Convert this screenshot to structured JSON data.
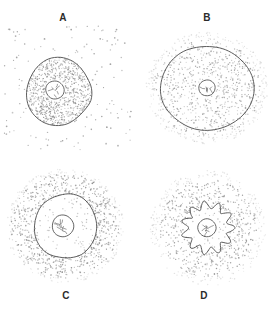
{
  "figure": {
    "background_color": "#ffffff",
    "ink_color": "#4a4a4a",
    "stipple_color": "#8d8d8d",
    "width": 273,
    "height": 311
  },
  "panels": [
    {
      "id": "A",
      "label": "A",
      "label_position": "above",
      "label_x": 63,
      "label_y": 12,
      "cell_shape": "irregular-rounded",
      "cell_center_x": 58,
      "cell_center_y": 92,
      "cell_radius": 33,
      "nucleus_center_x": 55,
      "nucleus_center_y": 90,
      "nucleus_radius": 9,
      "interior_stipple": "dense",
      "exterior_stipple": "sparse",
      "interior_dot_count": 760,
      "exterior_dot_count": 120,
      "description": "Cell with concentrated interior, dilute surroundings"
    },
    {
      "id": "B",
      "label": "B",
      "label_position": "above",
      "label_x": 207,
      "label_y": 12,
      "cell_shape": "smooth-ellipse",
      "cell_center_x": 207,
      "cell_center_y": 88,
      "cell_radius": 47,
      "nucleus_center_x": 207,
      "nucleus_center_y": 88,
      "nucleus_radius": 8,
      "interior_stipple": "medium",
      "exterior_stipple": "medium",
      "interior_dot_count": 520,
      "exterior_dot_count": 420,
      "description": "Swollen cell, equal concentration inside and outside"
    },
    {
      "id": "C",
      "label": "C",
      "label_position": "below",
      "label_x": 62,
      "label_y": 290,
      "cell_shape": "irregular-rounded",
      "cell_center_x": 65,
      "cell_center_y": 226,
      "cell_radius": 32,
      "nucleus_center_x": 63,
      "nucleus_center_y": 226,
      "nucleus_radius": 11,
      "interior_stipple": "sparse",
      "exterior_stipple": "dense",
      "interior_dot_count": 70,
      "exterior_dot_count": 900,
      "description": "Cell with dilute interior, concentrated surroundings"
    },
    {
      "id": "D",
      "label": "D",
      "label_position": "below",
      "label_x": 203,
      "label_y": 290,
      "cell_shape": "crenated",
      "cell_center_x": 208,
      "cell_center_y": 228,
      "cell_radius": 23,
      "crenation_lobes": 11,
      "nucleus_center_x": 207,
      "nucleus_center_y": 228,
      "nucleus_radius": 9,
      "interior_stipple": "sparse",
      "exterior_stipple": "dense",
      "interior_dot_count": 40,
      "exterior_dot_count": 780,
      "description": "Shrunken crenated cell in concentrated surroundings"
    }
  ]
}
